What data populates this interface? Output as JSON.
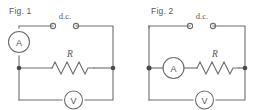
{
  "document": {
    "kind": "circuit-diagram-pair",
    "background_color": "#ffffff",
    "line_color": "#6e6e70",
    "text_color": "#58585a"
  },
  "figures": [
    {
      "id": "fig1",
      "caption": "Fig. 1",
      "source_label": "d.c.",
      "ammeter_label": "A",
      "voltmeter_label": "V",
      "resistor_label": "R",
      "ammeter_position": "left-rail",
      "description": "Ammeter in the left supply rail; resistor on the middle branch; voltmeter across the bottom branch in parallel with the resistor."
    },
    {
      "id": "fig2",
      "caption": "Fig. 2",
      "source_label": "d.c.",
      "ammeter_label": "A",
      "voltmeter_label": "V",
      "resistor_label": "R",
      "ammeter_position": "middle-branch-series-with-resistor",
      "description": "Ammeter in series with the resistor on the middle branch; voltmeter across the bottom branch."
    }
  ]
}
